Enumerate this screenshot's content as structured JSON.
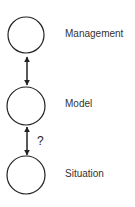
{
  "diagram": {
    "nodes": [
      {
        "id": "management",
        "label": "Management"
      },
      {
        "id": "model",
        "label": "Model"
      },
      {
        "id": "situation",
        "label": "Situation"
      }
    ],
    "edges": [
      {
        "from": "management",
        "to": "model",
        "direction": "bidirectional",
        "label": ""
      },
      {
        "from": "model",
        "to": "situation",
        "direction": "bidirectional",
        "label": "?"
      }
    ],
    "colors": {
      "stroke": "#222222",
      "text": "#333333",
      "background": "#ffffff"
    }
  }
}
